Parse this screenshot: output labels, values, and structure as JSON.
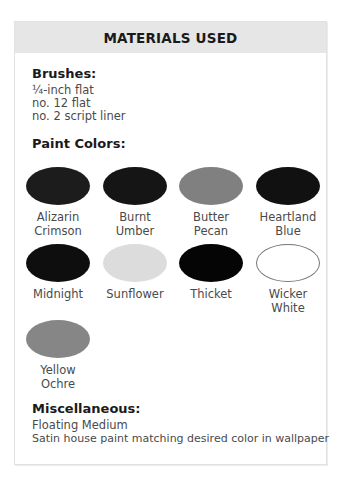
{
  "header": {
    "title": "MATERIALS USED"
  },
  "brushes": {
    "heading": "Brushes:",
    "items": [
      "¼-inch flat",
      "no. 12 flat",
      "no. 2 script liner"
    ]
  },
  "paint_colors": {
    "heading": "Paint Colors:",
    "swatches": [
      {
        "line1": "Alizarin",
        "line2": "Crimson",
        "color": "#1c1c1c"
      },
      {
        "line1": "Burnt",
        "line2": "Umber",
        "color": "#151515"
      },
      {
        "line1": "Butter",
        "line2": "Pecan",
        "color": "#808080"
      },
      {
        "line1": "Heartland",
        "line2": "Blue",
        "color": "#111111"
      },
      {
        "line1": "Midnight",
        "line2": "",
        "color": "#0e0e0e"
      },
      {
        "line1": "Sunflower",
        "line2": "",
        "color": "#dcdcdc"
      },
      {
        "line1": "Thicket",
        "line2": "",
        "color": "#050505"
      },
      {
        "line1": "Wicker",
        "line2": "White",
        "color": "#ffffff"
      },
      {
        "line1": "Yellow",
        "line2": "Ochre",
        "color": "#868686"
      }
    ]
  },
  "miscellaneous": {
    "heading": "Miscellaneous:",
    "items": [
      "Floating Medium",
      "Satin house paint matching desired color in wallpaper"
    ]
  }
}
